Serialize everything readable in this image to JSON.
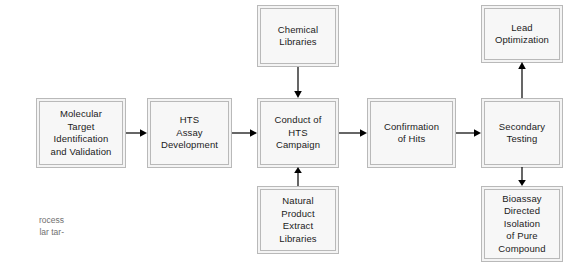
{
  "diagram": {
    "type": "flowchart",
    "colors": {
      "box_fill": "#f7f7f7",
      "box_border": "#b9b9b9",
      "text": "#1b1b1b",
      "connector": "#000000",
      "caption_text": "#707070",
      "background": "#ffffff"
    },
    "nodes": [
      {
        "id": "molecular-target",
        "label": "Molecular\nTarget\nIdentification\nand Validation",
        "x": 36,
        "y": 98,
        "w": 90,
        "h": 70
      },
      {
        "id": "hts-assay-development",
        "label": "HTS\nAssay\nDevelopment",
        "x": 147,
        "y": 98,
        "w": 85,
        "h": 70
      },
      {
        "id": "conduct-hts-campaign",
        "label": "Conduct of\nHTS\nCampaign",
        "x": 257,
        "y": 98,
        "w": 82,
        "h": 70
      },
      {
        "id": "confirmation-of-hits",
        "label": "Confirmation\nof Hits",
        "x": 367,
        "y": 98,
        "w": 89,
        "h": 70
      },
      {
        "id": "secondary-testing",
        "label": "Secondary\nTesting",
        "x": 481,
        "y": 98,
        "w": 82,
        "h": 70
      },
      {
        "id": "chemical-libraries",
        "label": "Chemical\nLibraries",
        "x": 257,
        "y": 5,
        "w": 82,
        "h": 62
      },
      {
        "id": "lead-optimization",
        "label": "Lead\nOptimization",
        "x": 481,
        "y": 5,
        "w": 82,
        "h": 58
      },
      {
        "id": "natural-product-extract-libraries",
        "label": "Natural\nProduct\nExtract\nLibraries",
        "x": 257,
        "y": 186,
        "w": 82,
        "h": 68
      },
      {
        "id": "bioassay-directed-isolation",
        "label": "Bioassay\nDirected\nIsolation\nof Pure\nCompound",
        "x": 481,
        "y": 186,
        "w": 82,
        "h": 76
      }
    ],
    "connectors": [
      {
        "id": "molecular-target-to-hts-assay",
        "from": "molecular-target",
        "to": "hts-assay-development",
        "direction": "right"
      },
      {
        "id": "hts-assay-to-conduct-hts",
        "from": "hts-assay-development",
        "to": "conduct-hts-campaign",
        "direction": "right"
      },
      {
        "id": "conduct-hts-to-confirmation",
        "from": "conduct-hts-campaign",
        "to": "confirmation-of-hits",
        "direction": "right"
      },
      {
        "id": "confirmation-to-secondary-testing",
        "from": "confirmation-of-hits",
        "to": "secondary-testing",
        "direction": "right"
      },
      {
        "id": "chemical-libraries-to-conduct-hts",
        "from": "chemical-libraries",
        "to": "conduct-hts-campaign",
        "direction": "down"
      },
      {
        "id": "natural-product-to-conduct-hts",
        "from": "natural-product-extract-libraries",
        "to": "conduct-hts-campaign",
        "direction": "up"
      },
      {
        "id": "secondary-testing-to-lead-optimization",
        "from": "secondary-testing",
        "to": "lead-optimization",
        "direction": "up"
      },
      {
        "id": "secondary-testing-to-bioassay",
        "from": "secondary-testing",
        "to": "bioassay-directed-isolation",
        "direction": "down"
      }
    ]
  },
  "caption": {
    "text": "rocess\nlar tar-"
  }
}
